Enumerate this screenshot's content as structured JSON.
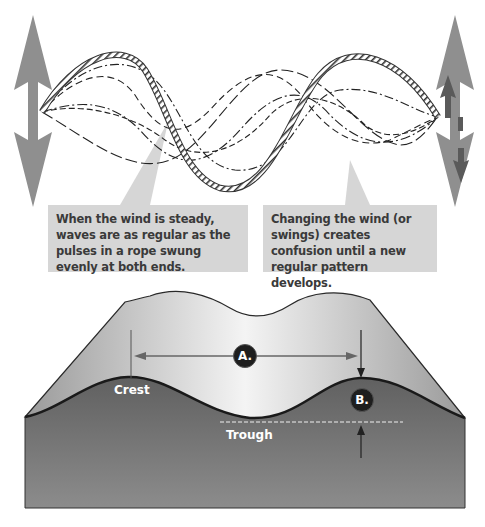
{
  "top_panel": {
    "captions": [
      {
        "id": "steady",
        "text": "When the wind is steady, waves are as regular as the pulses in a rope swung evenly at both ends."
      },
      {
        "id": "changing",
        "text": "Changing the wind (or swings) creates confusion until a new regular pattern develops."
      }
    ],
    "icons": {
      "left_arrow": "double-headed-vertical-arrow",
      "right_arrow": "double-headed-vertical-arrow-with-inner-arrows",
      "rope": "twisted-rope-wave"
    }
  },
  "bottom_panel": {
    "labels": {
      "crest": "Crest",
      "trough": "Trough",
      "a": "A.",
      "b": "B."
    }
  },
  "colors": {
    "arrow_gray": "#8f8f8f",
    "arrow_inner_dark": "#5a5a5a",
    "caption_bg": "#d6d6d6",
    "caption_text": "#3a3a3a",
    "water_dark": "#6e6e6e",
    "back_wave_light": "#bdbdbd",
    "badge_bg": "#1e1e1e"
  }
}
